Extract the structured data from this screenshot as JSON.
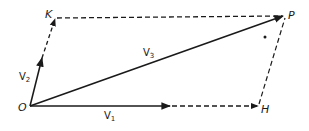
{
  "diagram": {
    "type": "vector-parallelogram",
    "points": {
      "O": {
        "label": "O",
        "x": 30,
        "y": 106
      },
      "K": {
        "label": "K",
        "x": 55,
        "y": 18
      },
      "P": {
        "label": "P",
        "x": 285,
        "y": 16
      },
      "H": {
        "label": "H",
        "x": 259,
        "y": 106
      }
    },
    "vectors": [
      {
        "name": "V",
        "sub": "1",
        "from": "O",
        "to": "H"
      },
      {
        "name": "V",
        "sub": "2",
        "from": "O",
        "to": "K"
      },
      {
        "name": "V",
        "sub": "3",
        "from": "O",
        "to": "P"
      }
    ],
    "labels": {
      "O": "O",
      "K": "K",
      "P": "P",
      "H": "H",
      "v1_main": "V",
      "v1_sub": "1",
      "v2_main": "V",
      "v2_sub": "2",
      "v3_main": "V",
      "v3_sub": "3"
    },
    "colors": {
      "ink": "#1a1a1a",
      "background": "#ffffff"
    }
  }
}
